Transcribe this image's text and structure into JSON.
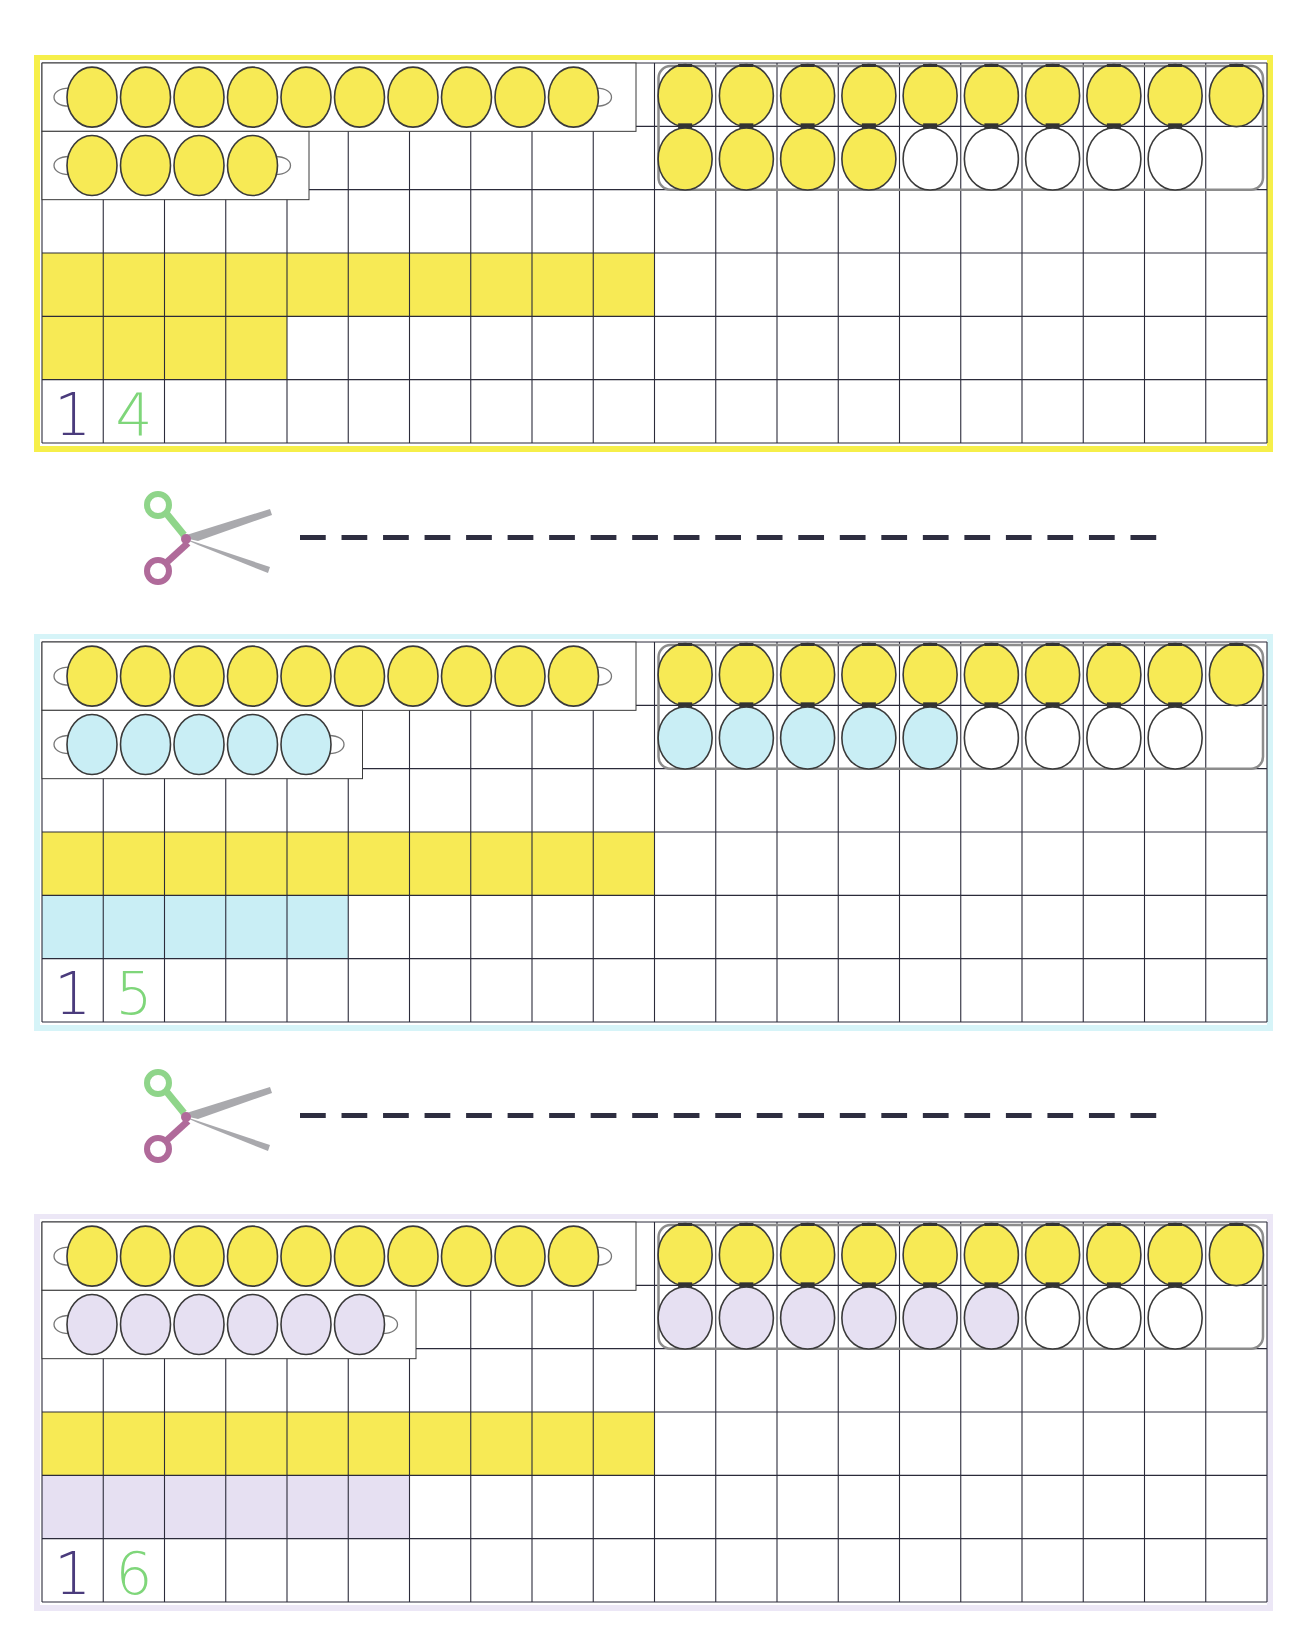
{
  "page": {
    "width": 1308,
    "height": 1628,
    "background": "#ffffff"
  },
  "grid": {
    "columns": 20,
    "rows": 6,
    "line_color": "#2b2b3a",
    "cell_width": 61.25,
    "cell_height": 63.33
  },
  "colors": {
    "yellow": "#f7ea55",
    "yellow_border": "#f6ef4a",
    "blue": "#c9eef5",
    "blue_border": "#d6f4f8",
    "lavender": "#e6e0f2",
    "lavender_border": "#ece7f6",
    "bead_outline": "#3a3a3a",
    "frame_outline": "#8c8c8c",
    "digit_tens": "#4a3b7c",
    "digit_ones": "#7fd67a",
    "dash": "#2e2e40"
  },
  "cards": [
    {
      "id": "card-14",
      "number": 14,
      "tens_digit": "1",
      "ones_digit": "4",
      "ones_color_key": "yellow",
      "ones_count": 4,
      "border_color_key": "yellow_border",
      "top": 55,
      "bead_strip_ten": {
        "count": 10,
        "color_key": "yellow"
      },
      "bead_strip_ones": {
        "count": 4,
        "color_key": "yellow"
      },
      "twenty_frame": {
        "top_row": {
          "filled": 10,
          "color_key": "yellow"
        },
        "bottom_row": {
          "filled": 4,
          "empty": 5,
          "color_key": "yellow"
        }
      },
      "bar_tens": {
        "cells": 10,
        "color_key": "yellow"
      },
      "bar_ones": {
        "cells": 4,
        "color_key": "yellow"
      }
    },
    {
      "id": "card-15",
      "number": 15,
      "tens_digit": "1",
      "ones_digit": "5",
      "ones_color_key": "blue",
      "ones_count": 5,
      "border_color_key": "blue_border",
      "top": 634,
      "bead_strip_ten": {
        "count": 10,
        "color_key": "yellow"
      },
      "bead_strip_ones": {
        "count": 5,
        "color_key": "blue"
      },
      "twenty_frame": {
        "top_row": {
          "filled": 10,
          "color_key": "yellow"
        },
        "bottom_row": {
          "filled": 5,
          "empty": 4,
          "color_key": "blue"
        }
      },
      "bar_tens": {
        "cells": 10,
        "color_key": "yellow"
      },
      "bar_ones": {
        "cells": 5,
        "color_key": "blue"
      }
    },
    {
      "id": "card-16",
      "number": 16,
      "tens_digit": "1",
      "ones_digit": "6",
      "ones_color_key": "lavender",
      "ones_count": 6,
      "border_color_key": "lavender_border",
      "top": 1214,
      "bead_strip_ten": {
        "count": 10,
        "color_key": "yellow"
      },
      "bead_strip_ones": {
        "count": 6,
        "color_key": "lavender"
      },
      "twenty_frame": {
        "top_row": {
          "filled": 10,
          "color_key": "yellow"
        },
        "bottom_row": {
          "filled": 6,
          "empty": 3,
          "color_key": "lavender"
        }
      },
      "bar_tens": {
        "cells": 10,
        "color_key": "yellow"
      },
      "bar_ones": {
        "cells": 6,
        "color_key": "lavender"
      }
    }
  ],
  "cut_lines": [
    {
      "id": "cut-line-1",
      "icon": "scissors-icon",
      "y": 537,
      "x_start": 300,
      "x_end": 1172,
      "dash_count": 21
    },
    {
      "id": "cut-line-2",
      "icon": "scissors-icon",
      "y": 1115,
      "x_start": 300,
      "x_end": 1172,
      "dash_count": 21
    }
  ],
  "scissors": {
    "handle_top_color": "#8fd58a",
    "handle_bottom_color": "#b06a9a",
    "blade_color": "#a9a9ad"
  }
}
